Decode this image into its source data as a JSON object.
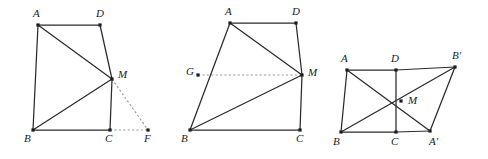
{
  "sheet": {
    "background_color": "#ffffff",
    "width": 488,
    "height": 159,
    "figure_count": 3,
    "solid_line_color": "#2b2b2b",
    "dashed_line_color": "#9a9a9a",
    "label_color": "#1b1b1b",
    "vertex_dot_color": "#1b1b1b"
  },
  "figures": [
    {
      "id": "figure-1",
      "name": "quadrilateral-abcd-with-extension-f",
      "points": {
        "A": {
          "label": "A",
          "x": 38,
          "y": 25,
          "label_x": 33,
          "label_y": 17
        },
        "D": {
          "label": "D",
          "x": 100,
          "y": 25,
          "label_x": 96,
          "label_y": 17
        },
        "M": {
          "label": "M",
          "x": 112,
          "y": 79,
          "label_x": 118,
          "label_y": 78
        },
        "B": {
          "label": "B",
          "x": 33,
          "y": 130,
          "label_x": 24,
          "label_y": 142
        },
        "C": {
          "label": "C",
          "x": 110,
          "y": 130,
          "label_x": 105,
          "label_y": 142
        },
        "F": {
          "label": "F",
          "x": 148,
          "y": 130,
          "label_x": 144,
          "label_y": 142
        }
      },
      "solid_edges": [
        [
          "A",
          "D"
        ],
        [
          "A",
          "B"
        ],
        [
          "A",
          "M"
        ],
        [
          "D",
          "M"
        ],
        [
          "M",
          "C"
        ],
        [
          "B",
          "M"
        ],
        [
          "B",
          "C"
        ]
      ],
      "dashed_edges": [
        [
          "M",
          "F"
        ],
        [
          "C",
          "F"
        ]
      ]
    },
    {
      "id": "figure-2",
      "name": "quadrilateral-abcd-with-midline-g",
      "points": {
        "A": {
          "label": "A",
          "x": 230,
          "y": 23,
          "label_x": 225,
          "label_y": 15
        },
        "D": {
          "label": "D",
          "x": 296,
          "y": 23,
          "label_x": 292,
          "label_y": 15
        },
        "G": {
          "label": "G",
          "x": 198,
          "y": 75,
          "label_x": 186,
          "label_y": 75
        },
        "M": {
          "label": "M",
          "x": 302,
          "y": 75,
          "label_x": 308,
          "label_y": 76
        },
        "B": {
          "label": "B",
          "x": 190,
          "y": 130,
          "label_x": 181,
          "label_y": 142
        },
        "C": {
          "label": "C",
          "x": 300,
          "y": 130,
          "label_x": 296,
          "label_y": 142
        }
      },
      "solid_edges": [
        [
          "A",
          "D"
        ],
        [
          "A",
          "B"
        ],
        [
          "A",
          "M"
        ],
        [
          "D",
          "M"
        ],
        [
          "M",
          "C"
        ],
        [
          "B",
          "M"
        ],
        [
          "B",
          "C"
        ]
      ],
      "dashed_edges": [
        [
          "G",
          "M"
        ]
      ]
    },
    {
      "id": "figure-3",
      "name": "parallelogram-with-rotated-copy",
      "points": {
        "A": {
          "label": "A",
          "x": 347,
          "y": 70,
          "label_x": 341,
          "label_y": 62
        },
        "D": {
          "label": "D",
          "x": 396,
          "y": 70,
          "label_x": 391,
          "label_y": 62
        },
        "Bp": {
          "label": "B'",
          "x": 455,
          "y": 67,
          "label_x": 452,
          "label_y": 59
        },
        "M": {
          "label": "M",
          "x": 401,
          "y": 101,
          "label_x": 408,
          "label_y": 104
        },
        "B": {
          "label": "B",
          "x": 341,
          "y": 132,
          "label_x": 333,
          "label_y": 145
        },
        "C": {
          "label": "C",
          "x": 396,
          "y": 132,
          "label_x": 391,
          "label_y": 145
        },
        "Ap": {
          "label": "A'",
          "x": 430,
          "y": 131,
          "label_x": 429,
          "label_y": 145
        }
      },
      "solid_edges": [
        [
          "A",
          "D"
        ],
        [
          "D",
          "Bp"
        ],
        [
          "A",
          "B"
        ],
        [
          "B",
          "C"
        ],
        [
          "C",
          "Ap"
        ],
        [
          "D",
          "C"
        ],
        [
          "A",
          "Ap"
        ],
        [
          "B",
          "Bp"
        ],
        [
          "Bp",
          "Ap"
        ]
      ],
      "dashed_edges": []
    }
  ]
}
